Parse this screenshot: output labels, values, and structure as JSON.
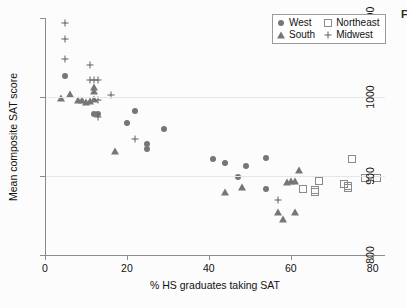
{
  "edge_text": "F",
  "legend": {
    "entries": [
      {
        "label": "West",
        "marker": "filled-circle-icon",
        "region": "West"
      },
      {
        "label": "Northeast",
        "marker": "open-square-icon",
        "region": "Northeast"
      },
      {
        "label": "South",
        "marker": "filled-triangle-icon",
        "region": "South"
      },
      {
        "label": "Midwest",
        "marker": "plus-icon",
        "region": "Midwest"
      }
    ]
  },
  "chart_data": {
    "type": "scatter",
    "title": "",
    "xlabel": "% HS graduates taking SAT",
    "ylabel": "Mean composite SAT score",
    "xlim": [
      0,
      83
    ],
    "ylim": [
      800,
      1100
    ],
    "xticks": [
      0,
      20,
      40,
      60,
      80
    ],
    "yticks": [
      800,
      900,
      1000,
      1100
    ],
    "xtick_labels": [
      "0",
      "20",
      "40",
      "60",
      "80"
    ],
    "ytick_labels": [
      "800",
      "900",
      "1000",
      "1100"
    ],
    "grid": "horizontal-at-900-and-1000",
    "legend_position": "top-right",
    "series": [
      {
        "name": "West",
        "marker": "filled-circle",
        "color": "#767676",
        "points": [
          [
            5,
            1027
          ],
          [
            12,
            978
          ],
          [
            13,
            979
          ],
          [
            22,
            982
          ],
          [
            20,
            967
          ],
          [
            29,
            959
          ],
          [
            25,
            934
          ],
          [
            25,
            941
          ],
          [
            41,
            921
          ],
          [
            44,
            916
          ],
          [
            47,
            899
          ],
          [
            49,
            913
          ],
          [
            54,
            923
          ],
          [
            54,
            884
          ]
        ]
      },
      {
        "name": "South",
        "marker": "filled-triangle",
        "color": "#767676",
        "points": [
          [
            4,
            999
          ],
          [
            6,
            1004
          ],
          [
            8,
            996
          ],
          [
            9,
            996
          ],
          [
            10,
            994
          ],
          [
            11,
            995
          ],
          [
            12,
            997
          ],
          [
            12,
            1013
          ],
          [
            12,
            1007
          ],
          [
            17,
            932
          ],
          [
            44,
            880
          ],
          [
            48,
            886
          ],
          [
            57,
            855
          ],
          [
            58,
            845
          ],
          [
            59,
            893
          ],
          [
            60,
            894
          ],
          [
            61,
            894
          ],
          [
            61,
            855
          ],
          [
            62,
            907
          ]
        ]
      },
      {
        "name": "Midwest",
        "marker": "plus",
        "color": "#5f5f5f",
        "points": [
          [
            5,
            1094
          ],
          [
            5,
            1074
          ],
          [
            5,
            1048
          ],
          [
            11,
            1041
          ],
          [
            11,
            1022
          ],
          [
            12,
            1021
          ],
          [
            13,
            1021
          ],
          [
            13,
            996
          ],
          [
            13,
            975
          ],
          [
            16,
            1002
          ],
          [
            22,
            947
          ],
          [
            57,
            869
          ]
        ]
      },
      {
        "name": "Northeast",
        "marker": "open-square",
        "color": "#8a8a8a",
        "points": [
          [
            63,
            884
          ],
          [
            66,
            882
          ],
          [
            66,
            880
          ],
          [
            67,
            894
          ],
          [
            73,
            890
          ],
          [
            74,
            887
          ],
          [
            74,
            885
          ],
          [
            75,
            921
          ],
          [
            78,
            898
          ],
          [
            81,
            898
          ]
        ]
      }
    ]
  }
}
